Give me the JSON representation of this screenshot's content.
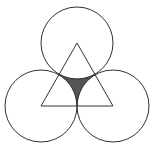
{
  "diagram": {
    "background": "#ffffff",
    "stroke_color": "#333333",
    "shade_color": "#555555",
    "radius": 36,
    "centers": [
      {
        "name": "top",
        "x": 77,
        "y": 43
      },
      {
        "name": "bottom-left",
        "x": 41,
        "y": 106
      },
      {
        "name": "bottom-right",
        "x": 113,
        "y": 106
      }
    ],
    "labels": []
  }
}
